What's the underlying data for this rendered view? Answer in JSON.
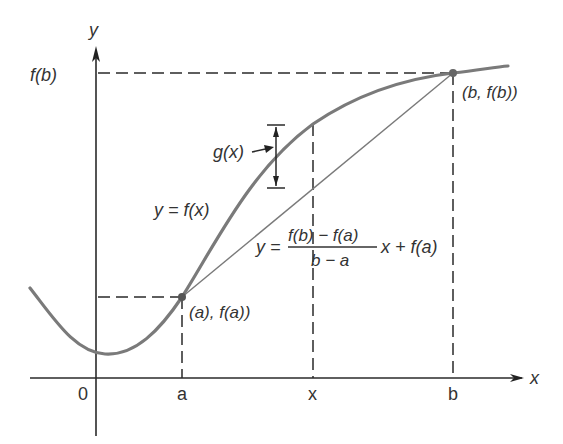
{
  "figure": {
    "axes": {
      "x_axis_label": "x",
      "y_axis_label": "y",
      "origin_label": "0",
      "x_ticks": [
        "a",
        "x",
        "b"
      ]
    },
    "labels": {
      "fb_tick": "f(b)",
      "point_b": "(b, f(b))",
      "point_a": "(a), f(a))",
      "gx": "g(x)",
      "curve": "y = f(x)",
      "secant_lhs": "y =",
      "secant_numerator": "f(b) − f(a)",
      "secant_denominator": "b − a",
      "secant_rhs": "x + f(a)"
    },
    "colors": {
      "curve": "#7a7a7a",
      "lines": "#2a2a2a",
      "text": "#333333"
    }
  }
}
